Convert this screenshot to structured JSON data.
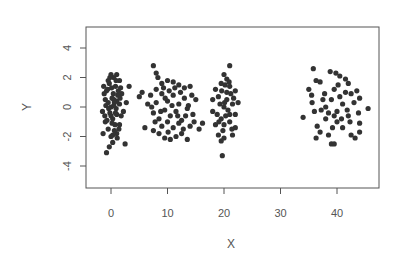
{
  "chart_data": {
    "type": "scatter",
    "title": "",
    "xlabel": "X",
    "ylabel": "Y",
    "xlim": [
      -4.5,
      47.5
    ],
    "ylim": [
      -5.4,
      5.4
    ],
    "x_ticks": [
      0,
      10,
      20,
      30,
      40
    ],
    "y_ticks": [
      -4,
      -2,
      0,
      2,
      4
    ],
    "grid": false,
    "legend": null,
    "point_color": "#333333",
    "series": [
      {
        "name": "cluster-0",
        "center": [
          0.5,
          0
        ],
        "points": [
          [
            -1.5,
            -0.3
          ],
          [
            -1,
            0.5
          ],
          [
            -0.8,
            1.1
          ],
          [
            -0.5,
            1.8
          ],
          [
            0,
            2.2
          ],
          [
            0.5,
            2.0
          ],
          [
            1,
            2.2
          ],
          [
            1.5,
            1.8
          ],
          [
            -1,
            -1.0
          ],
          [
            -0.5,
            -1.5
          ],
          [
            0,
            -2.0
          ],
          [
            0.3,
            -2.4
          ],
          [
            -0.3,
            -2.7
          ],
          [
            -0.8,
            -3.1
          ],
          [
            1.0,
            -1.8
          ],
          [
            1.5,
            -1.2
          ],
          [
            2.5,
            -2.5
          ],
          [
            3.2,
            1.4
          ],
          [
            2.7,
            0.3
          ],
          [
            2.2,
            -0.3
          ],
          [
            0,
            0
          ],
          [
            0.5,
            0.5
          ],
          [
            1,
            -0.5
          ],
          [
            -0.5,
            0.3
          ],
          [
            0.3,
            -0.8
          ],
          [
            1.2,
            0.8
          ],
          [
            0.8,
            1.4
          ],
          [
            -0.2,
            -0.4
          ],
          [
            0.7,
            -1.2
          ],
          [
            1.5,
            0.2
          ],
          [
            -1.2,
            0.9
          ],
          [
            0.1,
            1.3
          ],
          [
            0.9,
            -0.1
          ],
          [
            1.8,
            -0.6
          ],
          [
            -0.7,
            -0.9
          ],
          [
            0.4,
            0.9
          ],
          [
            1.3,
            1.1
          ],
          [
            -0.3,
            1.6
          ],
          [
            0.6,
            -1.6
          ],
          [
            1.1,
            -2.1
          ],
          [
            -1.4,
            -1.8
          ],
          [
            0.2,
            -1.1
          ],
          [
            1.6,
            0.6
          ],
          [
            -0.9,
            0.1
          ],
          [
            0.5,
            0.1
          ],
          [
            1.0,
            0.4
          ],
          [
            0,
            -0.6
          ],
          [
            -0.4,
            -0.1
          ],
          [
            0.8,
            -0.4
          ],
          [
            1.4,
            -1.5
          ],
          [
            -0.6,
            1.2
          ],
          [
            0.2,
            0.6
          ],
          [
            1.7,
            1.3
          ],
          [
            -1.1,
            -0.6
          ],
          [
            0.9,
            1.8
          ],
          [
            0.3,
            -1.9
          ],
          [
            -0.2,
            2.0
          ],
          [
            1.9,
            0.9
          ],
          [
            -1.3,
            1.4
          ],
          [
            0.6,
            0.3
          ]
        ]
      },
      {
        "name": "cluster-10",
        "center": [
          10.5,
          0
        ],
        "points": [
          [
            7.5,
            2.8
          ],
          [
            8,
            2.3
          ],
          [
            8.3,
            2.0
          ],
          [
            9,
            1.6
          ],
          [
            10,
            1.8
          ],
          [
            11,
            1.7
          ],
          [
            12,
            1.5
          ],
          [
            13,
            1.3
          ],
          [
            14,
            1.4
          ],
          [
            14.3,
            0.8
          ],
          [
            15,
            0.5
          ],
          [
            14.5,
            -0.5
          ],
          [
            14,
            -1.3
          ],
          [
            13.5,
            -2.2
          ],
          [
            12.5,
            -1.8
          ],
          [
            11.5,
            -2.0
          ],
          [
            10.5,
            -2.2
          ],
          [
            9.5,
            -2.1
          ],
          [
            8.5,
            -1.8
          ],
          [
            7.5,
            -1.6
          ],
          [
            6,
            -1.4
          ],
          [
            5,
            0.7
          ],
          [
            5.5,
            1.0
          ],
          [
            6.5,
            0.2
          ],
          [
            7,
            0.8
          ],
          [
            7.5,
            -0.4
          ],
          [
            8,
            0.3
          ],
          [
            8.5,
            -0.8
          ],
          [
            9,
            0.9
          ],
          [
            9.5,
            -0.2
          ],
          [
            10,
            0.4
          ],
          [
            10.5,
            -0.6
          ],
          [
            11,
            0.8
          ],
          [
            11.5,
            -0.3
          ],
          [
            12,
            0.2
          ],
          [
            12.5,
            -0.9
          ],
          [
            13,
            0.6
          ],
          [
            13.5,
            -0.1
          ],
          [
            9,
            -1.3
          ],
          [
            10,
            -1.0
          ],
          [
            11,
            -1.4
          ],
          [
            12,
            -1.1
          ],
          [
            8,
            1.2
          ],
          [
            10.3,
            1.1
          ],
          [
            12.3,
            1.0
          ],
          [
            13.7,
            0.1
          ],
          [
            7.8,
            -1.0
          ],
          [
            9.6,
            0.6
          ],
          [
            11.8,
            -0.6
          ],
          [
            10.8,
            0.1
          ],
          [
            8.8,
            -0.3
          ],
          [
            12.8,
            -1.5
          ],
          [
            9.3,
            1.3
          ],
          [
            11.3,
            1.3
          ],
          [
            10.1,
            -1.7
          ],
          [
            13.2,
            -0.6
          ],
          [
            7.2,
            0.0
          ],
          [
            14.7,
            -1.0
          ],
          [
            16.2,
            -1.1
          ],
          [
            15.6,
            -1.5
          ]
        ]
      },
      {
        "name": "cluster-20",
        "center": [
          20.5,
          0
        ],
        "points": [
          [
            21,
            2.8
          ],
          [
            20,
            2.2
          ],
          [
            20.5,
            1.9
          ],
          [
            19.5,
            1.6
          ],
          [
            21,
            1.4
          ],
          [
            18.5,
            1.2
          ],
          [
            22,
            1.1
          ],
          [
            18,
            0.5
          ],
          [
            22.5,
            0.3
          ],
          [
            18,
            -0.3
          ],
          [
            22,
            -0.5
          ],
          [
            18.5,
            -1.2
          ],
          [
            22,
            -1.4
          ],
          [
            19,
            -1.9
          ],
          [
            21.5,
            -1.9
          ],
          [
            19.5,
            -2.3
          ],
          [
            20,
            -2.1
          ],
          [
            19.7,
            -3.3
          ],
          [
            20,
            0
          ],
          [
            20.5,
            0.5
          ],
          [
            21,
            -0.5
          ],
          [
            19.5,
            -0.8
          ],
          [
            20.5,
            1.0
          ],
          [
            19,
            0.7
          ],
          [
            21.5,
            0.2
          ],
          [
            20,
            -1.2
          ],
          [
            21,
            -1.0
          ],
          [
            19.3,
            0.2
          ],
          [
            20.7,
            -0.2
          ],
          [
            20.2,
            1.5
          ],
          [
            19.8,
            -1.6
          ],
          [
            21.2,
            0.9
          ],
          [
            18.8,
            -0.5
          ],
          [
            20.9,
            1.7
          ],
          [
            19.6,
            1.1
          ],
          [
            21.4,
            -1.5
          ],
          [
            20.3,
            -0.6
          ],
          [
            19.1,
            -1.0
          ],
          [
            21.7,
            0.6
          ],
          [
            20.1,
            0.3
          ]
        ]
      },
      {
        "name": "cluster-40",
        "center": [
          40.5,
          0
        ],
        "points": [
          [
            34,
            -0.7
          ],
          [
            35,
            1.2
          ],
          [
            35.5,
            0.8
          ],
          [
            35.6,
            0.3
          ],
          [
            35.8,
            2.6
          ],
          [
            36.3,
            1.8
          ],
          [
            37,
            1.7
          ],
          [
            36,
            -0.3
          ],
          [
            36.5,
            -1.3
          ],
          [
            36.3,
            -2.1
          ],
          [
            37,
            -1.7
          ],
          [
            37.5,
            0.5
          ],
          [
            38,
            -0.8
          ],
          [
            38.5,
            -1.9
          ],
          [
            39,
            -2.5
          ],
          [
            39.5,
            -2.5
          ],
          [
            38.8,
            2.4
          ],
          [
            39.8,
            2.3
          ],
          [
            40.5,
            2.1
          ],
          [
            41.5,
            1.9
          ],
          [
            42,
            1.6
          ],
          [
            43.5,
            1.1
          ],
          [
            44,
            0.6
          ],
          [
            45.5,
            -0.1
          ],
          [
            44,
            -1.1
          ],
          [
            43.2,
            -2.1
          ],
          [
            44,
            -1.7
          ],
          [
            42.5,
            -1.9
          ],
          [
            41,
            -1.4
          ],
          [
            40,
            -1.0
          ],
          [
            38,
            0
          ],
          [
            39,
            0.5
          ],
          [
            40,
            -0.3
          ],
          [
            41,
            0.2
          ],
          [
            42,
            -0.6
          ],
          [
            43,
            0.3
          ],
          [
            39.5,
            1.2
          ],
          [
            41.5,
            1.0
          ],
          [
            40.5,
            0.7
          ],
          [
            42.5,
            0.9
          ],
          [
            38.5,
            -0.4
          ],
          [
            39.5,
            -0.6
          ],
          [
            40.8,
            -0.8
          ],
          [
            42.3,
            -1.0
          ],
          [
            37.8,
            0.9
          ],
          [
            41.8,
            -0.2
          ],
          [
            40.2,
            1.5
          ],
          [
            43.8,
            -0.4
          ],
          [
            39.2,
            -1.4
          ],
          [
            37.2,
            -0.2
          ]
        ]
      }
    ]
  }
}
